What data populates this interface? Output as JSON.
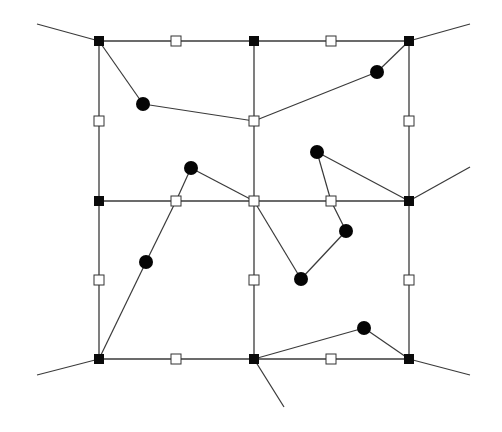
{
  "diagram": {
    "type": "mesh-graph",
    "colors": {
      "line": "#3a3a3a",
      "corner_node": "#0a0a0a",
      "mid_node_fill": "#ffffff",
      "mid_node_stroke": "#333333",
      "point": "#050505",
      "background": "#ffffff"
    },
    "grid": {
      "x": [
        99,
        254,
        409
      ],
      "y": [
        41,
        201,
        359
      ]
    },
    "corner_nodes": [
      {
        "id": "c00",
        "x": 99,
        "y": 41
      },
      {
        "id": "c10",
        "x": 254,
        "y": 41
      },
      {
        "id": "c20",
        "x": 409,
        "y": 41
      },
      {
        "id": "c01",
        "x": 99,
        "y": 201
      },
      {
        "id": "c21",
        "x": 409,
        "y": 201
      },
      {
        "id": "c02",
        "x": 99,
        "y": 359
      },
      {
        "id": "c12",
        "x": 254,
        "y": 359
      },
      {
        "id": "c22",
        "x": 409,
        "y": 359
      }
    ],
    "mid_nodes": [
      {
        "id": "m_top_l",
        "x": 176,
        "y": 41
      },
      {
        "id": "m_top_r",
        "x": 331,
        "y": 41
      },
      {
        "id": "m_left_t",
        "x": 99,
        "y": 121
      },
      {
        "id": "m_center_t",
        "x": 254,
        "y": 121
      },
      {
        "id": "m_right_t",
        "x": 409,
        "y": 121
      },
      {
        "id": "m_mid_l",
        "x": 176,
        "y": 201
      },
      {
        "id": "m_center",
        "x": 254,
        "y": 201
      },
      {
        "id": "m_mid_r",
        "x": 331,
        "y": 201
      },
      {
        "id": "m_left_b",
        "x": 99,
        "y": 280
      },
      {
        "id": "m_center_b",
        "x": 254,
        "y": 280
      },
      {
        "id": "m_right_b",
        "x": 409,
        "y": 280
      },
      {
        "id": "m_bot_l",
        "x": 176,
        "y": 359
      },
      {
        "id": "m_bot_r",
        "x": 331,
        "y": 359
      }
    ],
    "points": [
      {
        "id": "p1",
        "x": 143,
        "y": 104
      },
      {
        "id": "p2",
        "x": 377,
        "y": 72
      },
      {
        "id": "p3",
        "x": 191,
        "y": 168
      },
      {
        "id": "p4",
        "x": 317,
        "y": 152
      },
      {
        "id": "p5",
        "x": 146,
        "y": 262
      },
      {
        "id": "p6",
        "x": 346,
        "y": 231
      },
      {
        "id": "p7",
        "x": 301,
        "y": 279
      },
      {
        "id": "p8",
        "x": 364,
        "y": 328
      }
    ],
    "grid_edges": [
      [
        99,
        41,
        409,
        41
      ],
      [
        99,
        201,
        409,
        201
      ],
      [
        99,
        359,
        409,
        359
      ],
      [
        99,
        41,
        99,
        359
      ],
      [
        254,
        41,
        254,
        359
      ],
      [
        409,
        41,
        409,
        359
      ]
    ],
    "external_edges": [
      [
        37,
        24,
        99,
        41
      ],
      [
        409,
        41,
        470,
        24
      ],
      [
        409,
        201,
        470,
        167
      ],
      [
        37,
        375,
        99,
        359
      ],
      [
        409,
        359,
        470,
        375
      ],
      [
        254,
        359,
        284,
        407
      ]
    ],
    "path_edges": [
      [
        99,
        41,
        143,
        104
      ],
      [
        143,
        104,
        254,
        121
      ],
      [
        254,
        121,
        377,
        72
      ],
      [
        377,
        72,
        409,
        41
      ],
      [
        99,
        359,
        146,
        262
      ],
      [
        146,
        262,
        176,
        201
      ],
      [
        176,
        201,
        191,
        168
      ],
      [
        191,
        168,
        254,
        201
      ],
      [
        254,
        201,
        301,
        279
      ],
      [
        301,
        279,
        346,
        231
      ],
      [
        346,
        231,
        331,
        201
      ],
      [
        331,
        201,
        317,
        152
      ],
      [
        317,
        152,
        409,
        201
      ],
      [
        254,
        359,
        364,
        328
      ],
      [
        364,
        328,
        409,
        359
      ]
    ]
  }
}
